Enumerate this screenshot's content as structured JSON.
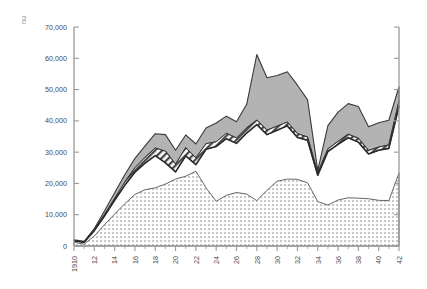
{
  "chart_data": {
    "type": "area",
    "title": "",
    "subtitle": "",
    "xlabel": "",
    "ylabel": "",
    "unit_label": "nu",
    "grid": false,
    "legend_position": "none",
    "xlim": [
      1910,
      1942
    ],
    "ylim": [
      0,
      70000
    ],
    "ytick_values": [
      0,
      10000,
      20000,
      30000,
      40000,
      50000,
      60000,
      70000
    ],
    "ytick_labels": [
      "0",
      "10,000",
      "20,000",
      "30,000",
      "40,000",
      "50,000",
      "60,000",
      "70,000"
    ],
    "xtick_values": [
      1910,
      1912,
      1914,
      1916,
      1918,
      1920,
      1922,
      1924,
      1926,
      1928,
      1930,
      1932,
      1934,
      1936,
      1938,
      1940,
      1942
    ],
    "xtick_labels": [
      "1910",
      "12",
      "14",
      "16",
      "18",
      "20",
      "22",
      "24",
      "26",
      "28",
      "30",
      "32",
      "34",
      "36",
      "38",
      "40",
      "42"
    ],
    "x": [
      1910,
      1911,
      1912,
      1913,
      1914,
      1915,
      1916,
      1917,
      1918,
      1919,
      1920,
      1921,
      1922,
      1923,
      1924,
      1925,
      1926,
      1927,
      1928,
      1929,
      1930,
      1931,
      1932,
      1933,
      1934,
      1935,
      1936,
      1937,
      1938,
      1939,
      1940,
      1941,
      1942
    ],
    "series": [
      {
        "name": "lower-band",
        "fill": "dotted",
        "values": [
          1200,
          600,
          3200,
          6800,
          10200,
          13500,
          16500,
          18000,
          18600,
          19800,
          21400,
          22300,
          23900,
          18600,
          14300,
          16200,
          17100,
          16600,
          14500,
          17800,
          20700,
          21400,
          21300,
          20200,
          14200,
          13100,
          14700,
          15400,
          15300,
          15100,
          14600,
          14500,
          23300
        ]
      },
      {
        "name": "middle-gap",
        "fill": "white",
        "values": [
          1600,
          1200,
          4900,
          9600,
          14600,
          19400,
          23600,
          26500,
          28900,
          26600,
          23700,
          28800,
          26000,
          30900,
          31800,
          34300,
          32800,
          36100,
          38800,
          35600,
          37000,
          38400,
          34700,
          33800,
          22600,
          30200,
          32500,
          34600,
          33200,
          29400,
          30600,
          31200,
          44700
        ]
      },
      {
        "name": "hatched-band",
        "fill": "hatched",
        "values": [
          1700,
          1300,
          5100,
          10000,
          15200,
          20400,
          25000,
          28300,
          31300,
          30300,
          26100,
          31400,
          28100,
          32700,
          33300,
          36000,
          34500,
          37700,
          40200,
          37000,
          38300,
          39600,
          35900,
          34800,
          23400,
          31000,
          33400,
          35700,
          34400,
          30500,
          31600,
          32300,
          46300
        ]
      },
      {
        "name": "upper-band",
        "fill": "gray",
        "values": [
          2000,
          1500,
          5600,
          11200,
          17000,
          22800,
          28000,
          32000,
          35900,
          35600,
          30600,
          35500,
          32600,
          37700,
          39300,
          41500,
          39700,
          45300,
          61200,
          53800,
          54500,
          55700,
          51400,
          46700,
          24200,
          38500,
          42800,
          45500,
          44600,
          38100,
          39400,
          40200,
          50900
        ]
      }
    ],
    "colors": {
      "upper_band_fill": "#b3b3b3",
      "upper_band_stroke": "#3a3a3a",
      "hatched_band_fill": "#ffffff",
      "hatched_band_stroke": "#2e2e2e",
      "lower_band_fill": "#ffffff",
      "lower_band_stroke": "#555555",
      "dark_line": "#2b2b2b",
      "axis": "#9a9a9a",
      "text": "#4a4a4a"
    }
  }
}
